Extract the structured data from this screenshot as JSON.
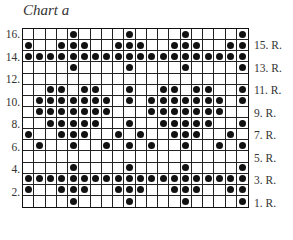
{
  "title": "Chart a",
  "grid": {
    "columns": 20,
    "rows": 16,
    "symbol": "filled-dot",
    "colors": {
      "line": "#111111",
      "dot": "#111111",
      "background": "#ffffff"
    },
    "rows_top_to_bottom": [
      {
        "row": 16,
        "dots": [
          5,
          10,
          15,
          20
        ]
      },
      {
        "row": 15,
        "dots": [
          1,
          4,
          5,
          6,
          9,
          10,
          11,
          14,
          15,
          16,
          19,
          20
        ]
      },
      {
        "row": 14,
        "dots": [
          1,
          2,
          3,
          4,
          5,
          6,
          7,
          8,
          9,
          10,
          11,
          12,
          13,
          14,
          15,
          16,
          17,
          18,
          19,
          20
        ]
      },
      {
        "row": 13,
        "dots": [
          5,
          10,
          15,
          20
        ]
      },
      {
        "row": 12,
        "dots": []
      },
      {
        "row": 11,
        "dots": [
          3,
          4,
          6,
          7,
          10,
          13,
          14,
          16,
          17,
          20
        ]
      },
      {
        "row": 10,
        "dots": [
          2,
          3,
          4,
          5,
          6,
          7,
          8,
          10,
          12,
          13,
          14,
          15,
          16,
          17,
          18,
          20
        ]
      },
      {
        "row": 9,
        "dots": [
          2,
          3,
          4,
          5,
          6,
          7,
          8,
          12,
          13,
          14,
          15,
          16,
          17,
          18
        ]
      },
      {
        "row": 8,
        "dots": [
          3,
          4,
          5,
          6,
          7,
          10,
          13,
          14,
          15,
          16,
          17,
          20
        ]
      },
      {
        "row": 7,
        "dots": [
          1,
          4,
          5,
          6,
          9,
          11,
          14,
          15,
          16,
          19
        ]
      },
      {
        "row": 6,
        "dots": [
          2,
          5,
          8,
          10,
          12,
          15,
          18,
          20
        ]
      },
      {
        "row": 5,
        "dots": []
      },
      {
        "row": 4,
        "dots": [
          5,
          10,
          15,
          20
        ]
      },
      {
        "row": 3,
        "dots": [
          1,
          2,
          3,
          4,
          5,
          6,
          7,
          8,
          9,
          10,
          11,
          12,
          13,
          14,
          15,
          16,
          17,
          18,
          19,
          20
        ]
      },
      {
        "row": 2,
        "dots": [
          1,
          4,
          5,
          6,
          9,
          10,
          11,
          14,
          15,
          16,
          19,
          20
        ]
      },
      {
        "row": 1,
        "dots": [
          5,
          10,
          15,
          20
        ]
      }
    ]
  },
  "labels": {
    "left": [
      {
        "row": 16,
        "text": "16."
      },
      {
        "row": 14,
        "text": "14."
      },
      {
        "row": 12,
        "text": "12."
      },
      {
        "row": 10,
        "text": "10."
      },
      {
        "row": 8,
        "text": "8."
      },
      {
        "row": 6,
        "text": "6."
      },
      {
        "row": 4,
        "text": "4."
      },
      {
        "row": 2,
        "text": "2."
      }
    ],
    "right": [
      {
        "row": 15,
        "text": "15. R."
      },
      {
        "row": 13,
        "text": "13. R."
      },
      {
        "row": 11,
        "text": "11. R."
      },
      {
        "row": 9,
        "text": "9. R."
      },
      {
        "row": 7,
        "text": "7. R."
      },
      {
        "row": 5,
        "text": "5. R."
      },
      {
        "row": 3,
        "text": "3. R."
      },
      {
        "row": 1,
        "text": "1. R."
      }
    ]
  }
}
